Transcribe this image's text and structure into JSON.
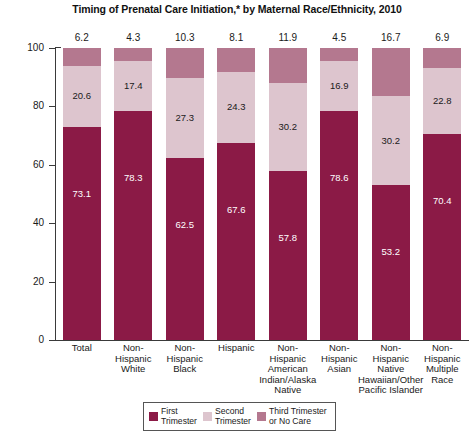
{
  "chart_data": {
    "type": "bar",
    "subtype": "stacked-bar-100",
    "title": "Timing of Prenatal Care Initiation,* by Maternal Race/Ethnicity, 2010",
    "xlabel": "",
    "ylabel": "Percent of Mothers",
    "ylim": [
      0,
      100
    ],
    "yticks": [
      0,
      20,
      40,
      60,
      80,
      100
    ],
    "ytick_labels": [
      "0",
      "20",
      "40",
      "60",
      "80",
      "100"
    ],
    "grid": false,
    "legend_position": "bottom",
    "categories": [
      "Total",
      "Non-\nHispanic\nWhite",
      "Non-\nHispanic\nBlack",
      "Hispanic",
      "Non-\nHispanic\nAmerican\nIndian/Alaska\nNative",
      "Non-\nHispanic\nAsian",
      "Non-\nHispanic\nNative\nHawaiian/Other\nPacific Islander",
      "Non-\nHispanic\nMultiple\nRace"
    ],
    "series": [
      {
        "name": "First\nTrimester",
        "color": "#8B1A46",
        "values": [
          73.1,
          78.3,
          62.5,
          67.6,
          57.8,
          78.6,
          53.2,
          70.4
        ]
      },
      {
        "name": "Second\nTrimester",
        "color": "#DDC5CE",
        "values": [
          20.6,
          17.4,
          27.3,
          24.3,
          30.2,
          16.9,
          30.2,
          22.8
        ]
      },
      {
        "name": "Third Trimester\nor No Care",
        "color": "#B4788F",
        "values": [
          6.2,
          4.3,
          10.3,
          8.1,
          11.9,
          4.5,
          16.7,
          6.9
        ]
      }
    ]
  }
}
